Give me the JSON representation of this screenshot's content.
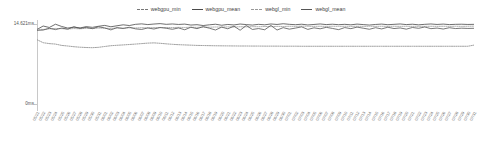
{
  "legend": {
    "position": "top-center",
    "items": [
      {
        "label": "webgpu_min",
        "color": "#777777",
        "style": "dashed",
        "icon": "line-dashed-icon"
      },
      {
        "label": "webgpu_mean",
        "color": "#4a4a4a",
        "style": "solid",
        "icon": "line-solid-icon"
      },
      {
        "label": "webgl_min",
        "color": "#999999",
        "style": "dashed",
        "icon": "line-dashed-icon"
      },
      {
        "label": "webgl_mean",
        "color": "#555555",
        "style": "solid",
        "icon": "line-solid-icon"
      }
    ]
  },
  "axes": {
    "y_top_label": "14.621ms",
    "y_bottom_label": "0ms"
  },
  "chart_data": {
    "type": "line",
    "title": "",
    "xlabel": "",
    "ylabel": "",
    "ylim": [
      0,
      14.621
    ],
    "yunit": "ms",
    "grid": false,
    "legend_position": "top-center",
    "y_ticks": [
      0,
      14.621
    ],
    "y_tick_labels": [
      "0ms",
      "14.621ms"
    ],
    "x": [
      "05/21",
      "05/22",
      "05/23",
      "05/24",
      "05/25",
      "05/26",
      "05/27",
      "05/28",
      "05/29",
      "05/30",
      "05/31",
      "06/01",
      "06/02",
      "06/03",
      "06/04",
      "06/05",
      "06/06",
      "06/07",
      "06/08",
      "06/09",
      "06/10",
      "06/11",
      "06/12",
      "06/13",
      "06/14",
      "06/15",
      "06/16",
      "06/17",
      "06/18",
      "06/19",
      "06/20",
      "06/21",
      "06/22",
      "06/23",
      "06/24",
      "06/25",
      "06/26",
      "06/27",
      "06/28",
      "06/29",
      "06/30",
      "07/01",
      "07/02",
      "07/03",
      "07/04",
      "07/05",
      "07/06",
      "07/07",
      "07/08",
      "07/09",
      "07/10",
      "07/11",
      "07/12",
      "07/13",
      "07/14",
      "07/15",
      "07/16",
      "07/17",
      "07/18",
      "07/19",
      "07/20",
      "07/21",
      "07/22",
      "07/23",
      "07/24",
      "07/25",
      "07/26",
      "07/27",
      "07/28",
      "07/29",
      "07/30",
      "07/31"
    ],
    "series": [
      {
        "name": "webgpu_min",
        "color": "#888888",
        "style": "dashed",
        "values": [
          11.35,
          10.85,
          10.7,
          10.62,
          10.4,
          10.3,
          10.18,
          10.1,
          10.05,
          10.02,
          10.08,
          10.22,
          10.35,
          10.42,
          10.48,
          10.55,
          10.62,
          10.7,
          10.78,
          10.82,
          10.75,
          10.66,
          10.58,
          10.52,
          10.48,
          10.44,
          10.4,
          10.38,
          10.36,
          10.34,
          10.33,
          10.32,
          10.31,
          10.3,
          10.3,
          10.29,
          10.29,
          10.28,
          10.28,
          10.28,
          10.27,
          10.27,
          10.27,
          10.26,
          10.26,
          10.26,
          10.26,
          10.26,
          10.26,
          10.26,
          10.26,
          10.26,
          10.26,
          10.26,
          10.26,
          10.26,
          10.26,
          10.26,
          10.26,
          10.26,
          10.26,
          10.26,
          10.26,
          10.26,
          10.26,
          10.26,
          10.26,
          10.26,
          10.26,
          10.26,
          10.26,
          10.45
        ]
      },
      {
        "name": "webgpu_mean",
        "color": "#4a4a4a",
        "style": "solid",
        "values": [
          13.05,
          13.62,
          13.38,
          13.92,
          13.55,
          13.28,
          13.45,
          13.3,
          13.52,
          13.4,
          13.58,
          13.72,
          13.5,
          13.66,
          13.82,
          13.7,
          13.9,
          13.98,
          13.86,
          13.95,
          14.02,
          13.9,
          13.96,
          13.88,
          13.94,
          13.78,
          13.84,
          13.7,
          13.82,
          13.92,
          13.75,
          13.88,
          13.8,
          13.95,
          13.86,
          13.78,
          13.9,
          13.82,
          13.96,
          13.88,
          14.0,
          13.9,
          13.84,
          13.92,
          13.8,
          13.88,
          13.96,
          13.86,
          13.92,
          13.84,
          13.9,
          13.82,
          13.94,
          13.86,
          13.78,
          13.88,
          13.94,
          13.84,
          13.9,
          13.96,
          13.86,
          13.92,
          13.82,
          13.9,
          13.96,
          13.88,
          13.94,
          13.86,
          13.9,
          13.92,
          13.88,
          13.9
        ]
      },
      {
        "name": "webgl_min",
        "color": "#9a9a9a",
        "style": "dashed",
        "values": [
          13.1,
          13.05,
          13.15,
          13.22,
          13.18,
          13.12,
          13.2,
          13.16,
          13.24,
          13.2,
          13.28,
          13.26,
          13.22,
          13.3,
          13.28,
          13.32,
          13.3,
          13.34,
          13.32,
          13.36,
          13.34,
          13.38,
          13.36,
          13.4,
          13.38,
          13.42,
          13.4,
          13.44,
          13.42,
          13.46,
          13.44,
          13.48,
          13.46,
          13.5,
          13.48,
          13.52,
          13.5,
          13.54,
          13.52,
          13.56,
          13.54,
          13.58,
          13.56,
          13.6,
          13.58,
          13.56,
          13.58,
          13.56,
          13.58,
          13.56,
          13.58,
          13.56,
          13.58,
          13.56,
          13.58,
          13.56,
          13.58,
          13.56,
          13.58,
          13.56,
          13.58,
          13.56,
          13.58,
          13.56,
          13.58,
          13.56,
          13.58,
          13.56,
          13.58,
          13.56,
          13.58,
          13.6
        ]
      },
      {
        "name": "webgl_mean",
        "color": "#555555",
        "style": "solid",
        "values": [
          12.9,
          12.95,
          13.25,
          13.02,
          13.28,
          13.1,
          13.48,
          13.22,
          13.4,
          13.18,
          13.5,
          13.3,
          12.98,
          13.35,
          13.2,
          13.42,
          13.15,
          13.05,
          13.3,
          13.12,
          13.38,
          13.24,
          13.08,
          13.3,
          13.0,
          13.42,
          13.18,
          13.52,
          13.26,
          12.96,
          13.44,
          13.16,
          13.6,
          12.92,
          13.7,
          13.05,
          13.2,
          13.0,
          13.72,
          12.95,
          13.35,
          13.1,
          13.28,
          13.48,
          13.06,
          13.32,
          13.16,
          13.4,
          13.22,
          13.02,
          13.36,
          13.18,
          13.44,
          13.26,
          13.08,
          13.34,
          13.14,
          13.42,
          13.2,
          13.3,
          13.1,
          13.38,
          13.24,
          13.46,
          13.18,
          13.28,
          13.12,
          13.34,
          13.2,
          13.26,
          13.22,
          13.24
        ]
      }
    ]
  }
}
